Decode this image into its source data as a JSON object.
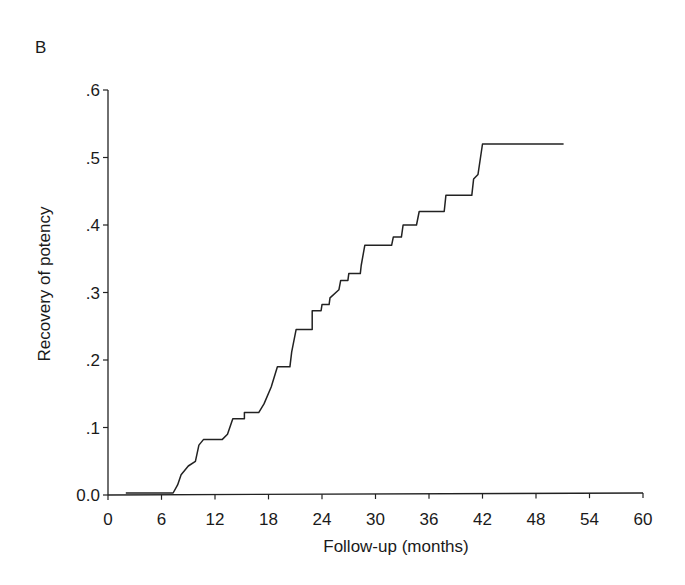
{
  "panel_label": "B",
  "chart_data": {
    "type": "line",
    "subtype": "step (Kaplan-Meier cumulative incidence)",
    "title": "",
    "panel": "B",
    "xlabel": "Follow-up (months)",
    "ylabel": "Recovery of potency",
    "xlim": [
      0,
      60
    ],
    "ylim": [
      0,
      0.6
    ],
    "xticks": [
      0,
      6,
      12,
      18,
      24,
      30,
      36,
      42,
      48,
      54,
      60
    ],
    "xtick_labels": [
      "0",
      "6",
      "12",
      "18",
      "24",
      "30",
      "36",
      "42",
      "48",
      "54",
      "60"
    ],
    "yticks": [
      0,
      0.1,
      0.2,
      0.3,
      0.4,
      0.5,
      0.6
    ],
    "ytick_labels": [
      "0.0",
      ".1",
      ".2",
      ".3",
      ".4",
      ".5",
      ".6"
    ],
    "grid": false,
    "legend": null,
    "series": [
      {
        "name": "Recovery of potency",
        "color": "#222222",
        "points": [
          [
            2.0,
            0.003
          ],
          [
            7.3,
            0.003
          ],
          [
            7.8,
            0.015
          ],
          [
            8.2,
            0.03
          ],
          [
            9.0,
            0.043
          ],
          [
            9.8,
            0.05
          ],
          [
            10.2,
            0.074
          ],
          [
            10.7,
            0.082
          ],
          [
            12.8,
            0.082
          ],
          [
            13.4,
            0.09
          ],
          [
            14.0,
            0.113
          ],
          [
            15.3,
            0.113
          ],
          [
            15.3,
            0.122
          ],
          [
            16.9,
            0.122
          ],
          [
            17.5,
            0.135
          ],
          [
            18.3,
            0.16
          ],
          [
            19.0,
            0.19
          ],
          [
            20.4,
            0.19
          ],
          [
            20.6,
            0.212
          ],
          [
            21.1,
            0.245
          ],
          [
            22.9,
            0.245
          ],
          [
            22.9,
            0.273
          ],
          [
            23.9,
            0.273
          ],
          [
            24.0,
            0.282
          ],
          [
            24.8,
            0.282
          ],
          [
            24.9,
            0.292
          ],
          [
            25.9,
            0.304
          ],
          [
            26.1,
            0.318
          ],
          [
            26.9,
            0.318
          ],
          [
            27.0,
            0.328
          ],
          [
            28.3,
            0.328
          ],
          [
            28.4,
            0.34
          ],
          [
            28.8,
            0.37
          ],
          [
            31.8,
            0.37
          ],
          [
            32.0,
            0.382
          ],
          [
            32.9,
            0.382
          ],
          [
            33.1,
            0.4
          ],
          [
            34.6,
            0.4
          ],
          [
            34.9,
            0.42
          ],
          [
            37.7,
            0.42
          ],
          [
            37.9,
            0.444
          ],
          [
            40.8,
            0.444
          ],
          [
            41.0,
            0.468
          ],
          [
            41.5,
            0.475
          ],
          [
            42.0,
            0.52
          ],
          [
            51.1,
            0.52
          ]
        ]
      }
    ]
  }
}
